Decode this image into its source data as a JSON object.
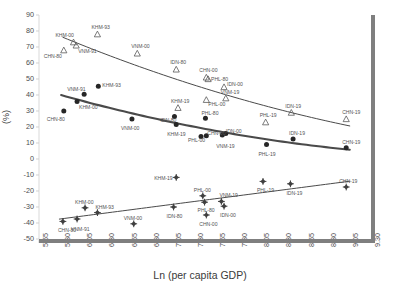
{
  "chart_data": {
    "type": "scatter",
    "title": "",
    "xlabel": "Ln (per capita GDP)",
    "ylabel": "(%)",
    "xlim": [
      5.55,
      9.3
    ],
    "ylim": [
      -50,
      90
    ],
    "xticks": [
      "5.55",
      "5.80",
      "6.05",
      "6.30",
      "6.55",
      "6.80",
      "7.05",
      "7.30",
      "7.55",
      "7.80",
      "8.05",
      "8.30",
      "8.55",
      "8.80",
      "9.05",
      "9.30"
    ],
    "yticks": [
      "90",
      "80",
      "70",
      "60",
      "50",
      "40",
      "30",
      "20",
      "10",
      "0",
      "-10",
      "-20",
      "-30",
      "-40",
      "-50"
    ],
    "grid": false,
    "legend": "none",
    "series": [
      {
        "name": "triangle-series",
        "marker": "open-triangle",
        "color": "#595959",
        "trend": "decreasing",
        "points": [
          {
            "label": "CHN-80",
            "x": 5.83,
            "y": 68
          },
          {
            "label": "KHM-00",
            "x": 5.94,
            "y": 73
          },
          {
            "label": "VNM-91",
            "x": 5.97,
            "y": 71
          },
          {
            "label": "KHM-93",
            "x": 6.21,
            "y": 78
          },
          {
            "label": "VNM-00",
            "x": 6.66,
            "y": 66
          },
          {
            "label": "IDN-80",
            "x": 7.1,
            "y": 56
          },
          {
            "label": "CHN-00",
            "x": 7.44,
            "y": 51
          },
          {
            "label": "PHL-80",
            "x": 7.46,
            "y": 50
          },
          {
            "label": "IDN-00",
            "x": 7.64,
            "y": 45
          },
          {
            "label": "KHM-19",
            "x": 7.12,
            "y": 32
          },
          {
            "label": "PHL-00",
            "x": 7.44,
            "y": 37
          },
          {
            "label": "VNM-19",
            "x": 7.66,
            "y": 38
          },
          {
            "label": "PHL-19",
            "x": 8.11,
            "y": 23
          },
          {
            "label": "IDN-19",
            "x": 8.4,
            "y": 29
          },
          {
            "label": "CHN-19",
            "x": 9.02,
            "y": 25
          }
        ]
      },
      {
        "name": "circle-series",
        "marker": "filled-circle",
        "color": "#262626",
        "trend": "decreasing",
        "points": [
          {
            "label": "CHN-80",
            "x": 5.83,
            "y": 30
          },
          {
            "label": "KHM-00",
            "x": 5.98,
            "y": 36
          },
          {
            "label": "VNM-91",
            "x": 6.06,
            "y": 40.5
          },
          {
            "label": "KHM-93",
            "x": 6.22,
            "y": 45.5
          },
          {
            "label": "VNM-00",
            "x": 6.6,
            "y": 25
          },
          {
            "label": "IDN-80",
            "x": 7.08,
            "y": 26.5
          },
          {
            "label": "KHM-19",
            "x": 7.1,
            "y": 21.5
          },
          {
            "label": "PHL-00",
            "x": 7.38,
            "y": 14
          },
          {
            "label": "PHL-80",
            "x": 7.43,
            "y": 25.5
          },
          {
            "label": "CHN-00",
            "x": 7.44,
            "y": 14.5
          },
          {
            "label": "VNM-19",
            "x": 7.62,
            "y": 15
          },
          {
            "label": "IDN-00",
            "x": 7.66,
            "y": 16
          },
          {
            "label": "PHL-19",
            "x": 8.12,
            "y": 9
          },
          {
            "label": "IDN-19",
            "x": 8.42,
            "y": 12.5
          },
          {
            "label": "CHN-19",
            "x": 9.02,
            "y": 7
          }
        ]
      },
      {
        "name": "diamond-series",
        "marker": "filled-diamond",
        "color": "#404040",
        "trend": "increasing",
        "points": [
          {
            "label": "CHN-80",
            "x": 5.82,
            "y": -39
          },
          {
            "label": "VNM-91",
            "x": 5.98,
            "y": -37.5
          },
          {
            "label": "KHM-00",
            "x": 6.07,
            "y": -30.5
          },
          {
            "label": "KHM-93",
            "x": 6.21,
            "y": -33.5
          },
          {
            "label": "VNM-00",
            "x": 6.62,
            "y": -40.5
          },
          {
            "label": "KHM-19",
            "x": 7.1,
            "y": -11.5
          },
          {
            "label": "IDN-80",
            "x": 7.07,
            "y": -30
          },
          {
            "label": "PHL-00",
            "x": 7.4,
            "y": -23
          },
          {
            "label": "PHL-80",
            "x": 7.42,
            "y": -27
          },
          {
            "label": "CHN-00",
            "x": 7.44,
            "y": -35
          },
          {
            "label": "VNM-19",
            "x": 7.61,
            "y": -26.5
          },
          {
            "label": "IDN-00",
            "x": 7.64,
            "y": -29.5
          },
          {
            "label": "PHL-19",
            "x": 8.08,
            "y": -14
          },
          {
            "label": "IDN-19",
            "x": 8.39,
            "y": -15.5
          },
          {
            "label": "CHN-19",
            "x": 9.02,
            "y": -17.5
          }
        ]
      }
    ],
    "label_offsets": {
      "triangle-series": [
        {
          "label": "CHN-80",
          "dx": -20,
          "dy": 4
        },
        {
          "label": "KHM-00",
          "dx": -18,
          "dy": -9
        },
        {
          "label": "VNM-91",
          "dx": 2,
          "dy": 4
        },
        {
          "label": "KHM-93",
          "dx": -6,
          "dy": -9
        },
        {
          "label": "VNM-00",
          "dx": -6,
          "dy": -9
        },
        {
          "label": "IDN-80",
          "dx": -6,
          "dy": -9
        },
        {
          "label": "CHN-00",
          "dx": -7,
          "dy": -9
        },
        {
          "label": "PHL-80",
          "dx": 3,
          "dy": -2
        },
        {
          "label": "IDN-00",
          "dx": 3,
          "dy": -5
        },
        {
          "label": "KHM-19",
          "dx": -7,
          "dy": -9
        },
        {
          "label": "PHL-00",
          "dx": 2,
          "dy": 2
        },
        {
          "label": "VNM-19",
          "dx": -5,
          "dy": -8
        },
        {
          "label": "PHL-19",
          "dx": -6,
          "dy": -9
        },
        {
          "label": "IDN-19",
          "dx": -6,
          "dy": -9
        },
        {
          "label": "CHN-19",
          "dx": -4,
          "dy": -9
        }
      ],
      "circle-series": [
        {
          "label": "CHN-80",
          "dx": -17,
          "dy": 6
        },
        {
          "label": "KHM-00",
          "dx": 2,
          "dy": 4
        },
        {
          "label": "VNM-91",
          "dx": -17,
          "dy": -7
        },
        {
          "label": "KHM-93",
          "dx": 4,
          "dy": -3
        },
        {
          "label": "VNM-00",
          "dx": -11,
          "dy": 7
        },
        {
          "label": "IDN-80",
          "dx": -14,
          "dy": 1
        },
        {
          "label": "KHM-19",
          "dx": -9,
          "dy": 7
        },
        {
          "label": "PHL-00",
          "dx": -13,
          "dy": 1
        },
        {
          "label": "PHL-80",
          "dx": -4,
          "dy": -7
        },
        {
          "label": "CHN-00",
          "dx": 1,
          "dy": -5
        },
        {
          "label": "VNM-19",
          "dx": -6,
          "dy": 9
        },
        {
          "label": "IDN-00",
          "dx": 0,
          "dy": -4
        },
        {
          "label": "PHL-19",
          "dx": -8,
          "dy": 7
        },
        {
          "label": "IDN-19",
          "dx": -4,
          "dy": -8
        },
        {
          "label": "CHN-19",
          "dx": -4,
          "dy": -8
        }
      ],
      "diamond-series": [
        {
          "label": "CHN-80",
          "dx": -5,
          "dy": 7
        },
        {
          "label": "VNM-91",
          "dx": -6,
          "dy": 8
        },
        {
          "label": "KHM-00",
          "dx": -10,
          "dy": -8
        },
        {
          "label": "KHM-93",
          "dx": -2,
          "dy": -8
        },
        {
          "label": "VNM-00",
          "dx": -10,
          "dy": -8
        },
        {
          "label": "KHM-19",
          "dx": -22,
          "dy": -1
        },
        {
          "label": "IDN-80",
          "dx": -7,
          "dy": 7
        },
        {
          "label": "PHL-00",
          "dx": -9,
          "dy": -8
        },
        {
          "label": "PHL-80",
          "dx": -7,
          "dy": 6
        },
        {
          "label": "CHN-00",
          "dx": -7,
          "dy": 7
        },
        {
          "label": "VNM-19",
          "dx": -2,
          "dy": -8
        },
        {
          "label": "IDN-00",
          "dx": -4,
          "dy": 7
        },
        {
          "label": "PHL-19",
          "dx": -6,
          "dy": 7
        },
        {
          "label": "IDN-19",
          "dx": -4,
          "dy": 7
        },
        {
          "label": "CHN-19",
          "dx": -7,
          "dy": -8
        }
      ]
    }
  }
}
